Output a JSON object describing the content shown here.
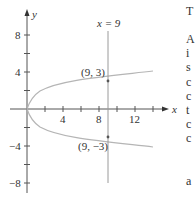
{
  "figure": {
    "axis_labels": {
      "x": "x",
      "y": "y"
    },
    "x_ticks": [
      "4",
      "8",
      "12"
    ],
    "y_ticks": [
      "8",
      "4",
      "−4",
      "−8"
    ],
    "line_label": "x = 9",
    "points": [
      {
        "label": "(9, 3)",
        "x": 9,
        "y": 3
      },
      {
        "label": "(9, −3)",
        "x": 9,
        "y": -3
      }
    ],
    "curve": "x = y^2 (parabola opening right)",
    "colors": {
      "axis": "#555555",
      "curve": "#b5b5b5",
      "line": "#9a9a9a",
      "text": "#333333"
    }
  },
  "margin_text_fragments": [
    "T",
    "A",
    "i",
    "s",
    "c",
    "c",
    "t",
    "c",
    "c",
    "a"
  ]
}
